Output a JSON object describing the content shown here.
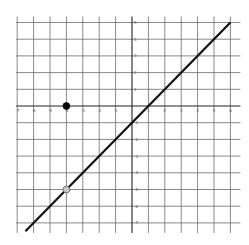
{
  "chart_data": {
    "type": "line",
    "title": "",
    "xlabel": "",
    "ylabel": "",
    "xlim": [
      -7,
      6
    ],
    "ylim": [
      -7,
      5
    ],
    "grid": true,
    "x_ticks": [
      -7,
      -6,
      -5,
      -4,
      -3,
      -2,
      -1,
      1,
      2,
      3,
      4,
      5,
      6
    ],
    "y_ticks": [
      5,
      4,
      3,
      2,
      1,
      -1,
      -2,
      -3,
      -4,
      -5,
      -6,
      -7
    ],
    "series": [
      {
        "name": "y = x - 1",
        "kind": "line",
        "slope": 1,
        "intercept": -1,
        "x": [
          -6.5,
          6.0
        ],
        "y": [
          -7.5,
          5.0
        ],
        "color": "#111111"
      }
    ],
    "points": [
      {
        "x": -4,
        "y": 0,
        "style": "closed",
        "color": "#000000"
      },
      {
        "x": -4,
        "y": -5,
        "style": "open",
        "color": "#c8c8c8"
      }
    ]
  }
}
